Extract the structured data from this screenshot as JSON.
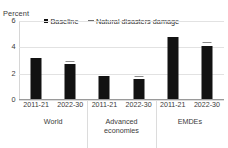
{
  "chart_data": {
    "type": "bar",
    "title": "",
    "subtitle": "",
    "xlabel": "",
    "ylabel": "Percent",
    "ylim": [
      0,
      6
    ],
    "yticks": [
      0,
      2,
      4,
      6
    ],
    "grid": true,
    "legend_position": "top",
    "groups": [
      {
        "name": "World",
        "name_lines": "World"
      },
      {
        "name": "Advanced economies",
        "name_lines": "Advanced\neconomies"
      },
      {
        "name": "EMDEs",
        "name_lines": "EMDEs"
      }
    ],
    "periods": [
      "2011-21",
      "2022-30"
    ],
    "categories": [
      "World 2011-21",
      "World 2022-30",
      "Advanced economies 2011-21",
      "Advanced economies 2022-30",
      "EMDEs 2011-21",
      "EMDEs 2022-30"
    ],
    "series": [
      {
        "name": "Baseline",
        "marker": "square",
        "color": "#121212",
        "values": [
          3.2,
          2.7,
          1.8,
          1.6,
          4.8,
          4.1
        ]
      },
      {
        "name": "Natural disasters damage",
        "marker": "dash",
        "color": "#8a8a8a",
        "values": [
          null,
          2.9,
          null,
          1.75,
          null,
          4.3
        ]
      }
    ]
  },
  "axis": {
    "unit_label": "Percent",
    "ytick_labels": [
      "6",
      "4",
      "2",
      "0"
    ]
  },
  "legend": {
    "items": [
      {
        "label": "Baseline",
        "marker": "square"
      },
      {
        "label": "Natural disasters damage",
        "marker": "dash"
      }
    ]
  },
  "colors": {
    "bar": "#121212",
    "marker": "#8a8a8a",
    "grid": "#e2e2e2",
    "axis": "#9a9a9a",
    "text": "#3a3a3a",
    "background": "#ffffff"
  }
}
